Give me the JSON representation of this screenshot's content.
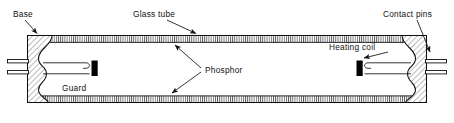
{
  "figure": {
    "type": "technical-cross-section",
    "background_color": "#ffffff",
    "line_color": "#111111",
    "hatch_color": "#555555",
    "fill_color": "#ffffff",
    "coil_color": "#000000"
  },
  "labels": {
    "base": "Base",
    "glass_tube": "Glass tube",
    "contact_pins": "Contact pins",
    "phosphor": "Phosphor",
    "heating_coil": "Heating coil",
    "guard": "Guard"
  },
  "parts": [
    {
      "id": "base",
      "label": "Base",
      "side": "left",
      "note": "hatched end cap"
    },
    {
      "id": "glass-tube",
      "label": "Glass tube",
      "side": "center",
      "note": "long horizontal envelope"
    },
    {
      "id": "phosphor",
      "label": "Phosphor",
      "side": "center",
      "note": "hatched coating on inner walls"
    },
    {
      "id": "guard",
      "label": "Guard",
      "side": "left",
      "note": "black block on lead"
    },
    {
      "id": "heating-coil",
      "label": "Heating coil",
      "side": "right",
      "note": "black block on lead"
    },
    {
      "id": "contact-pins",
      "label": "Contact pins",
      "side": "right",
      "note": "two pins protruding from cap"
    }
  ]
}
